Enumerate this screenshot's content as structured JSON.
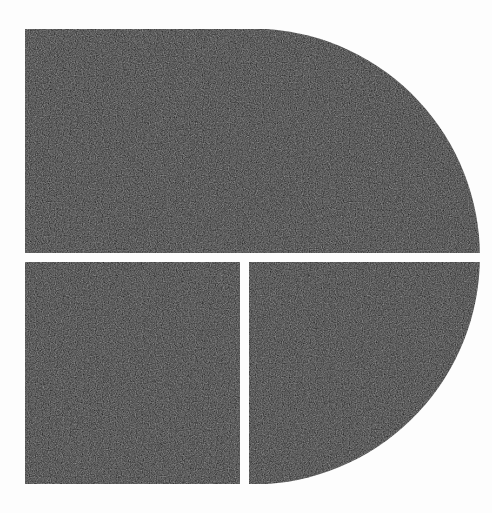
{
  "image": {
    "kind": "logo-mark",
    "subject": "stylized letter D",
    "alt_text": "Stylized letter D logo composed of three dark segments separated by thin white gaps",
    "canvas": {
      "width": 492,
      "height": 513
    },
    "background_color": "#fdfdfd",
    "mark_color": "#181818",
    "gap_color": "#fdfdfd",
    "texture": "fine film grain noise over flat dark fill"
  },
  "geometry": {
    "bounds": {
      "left": 25,
      "top": 29,
      "right": 472,
      "bottom": 484
    },
    "straight_edge_x": 25,
    "flat_top_end_x": 267,
    "flat_bottom_end_x": 358,
    "arc": {
      "center_x": 265,
      "center_y": 256,
      "radius": 228
    },
    "horizontal_gap": {
      "y_top": 253,
      "y_bottom": 262,
      "thickness": 9
    },
    "vertical_gap": {
      "x_left": 240,
      "x_right": 249,
      "thickness": 9
    }
  },
  "segments": [
    {
      "id": "upper",
      "name": "upper-bowl-segment",
      "description": "Top half of the D: flat left edge, flat top, curving right edge",
      "x": 25,
      "y": 29,
      "width": 447,
      "height": 224
    },
    {
      "id": "lower-left",
      "name": "lower-left-stem-segment",
      "description": "Bottom-left rectangular block forming the foot of the stem",
      "x": 25,
      "y": 262,
      "width": 215,
      "height": 222
    },
    {
      "id": "lower-right",
      "name": "lower-right-bowl-segment",
      "description": "Bottom-right quarter-round block completing the bowl of the D",
      "x": 249,
      "y": 262,
      "width": 223,
      "height": 222
    }
  ],
  "labels": {
    "figure_title": "D",
    "figure_note": "Three-part segmented D mark"
  }
}
